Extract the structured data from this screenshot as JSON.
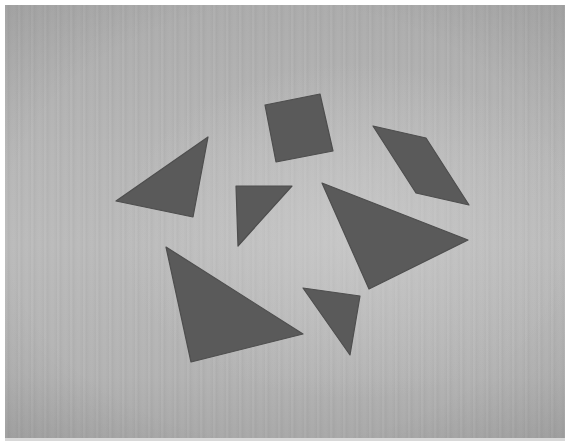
{
  "scene": {
    "description": "Seven grey tangram pieces scattered on a light wooden surface (grayscale photo)",
    "colors": {
      "piece": "#5a5a5a",
      "piece_edge": "#4e4e4e",
      "surface": "#b5b5b5",
      "border": "#ffffff"
    },
    "pieces": [
      {
        "id": "square",
        "kind": "square",
        "points": "265,105 320,94 333,151 276,162"
      },
      {
        "id": "parallelogram",
        "kind": "parallelogram",
        "points": "373,126 426,138 469,205 416,193"
      },
      {
        "id": "medium-triangle",
        "kind": "triangle",
        "points": "116,201 208,137 193,217"
      },
      {
        "id": "small-triangle-1",
        "kind": "triangle",
        "points": "236,186 292,186 238,246"
      },
      {
        "id": "large-triangle-1",
        "kind": "triangle",
        "points": "322,183 468,240 369,289"
      },
      {
        "id": "large-triangle-2",
        "kind": "triangle",
        "points": "166,247 303,334 191,362"
      },
      {
        "id": "small-triangle-2",
        "kind": "triangle",
        "points": "303,288 360,296 350,355"
      }
    ]
  }
}
